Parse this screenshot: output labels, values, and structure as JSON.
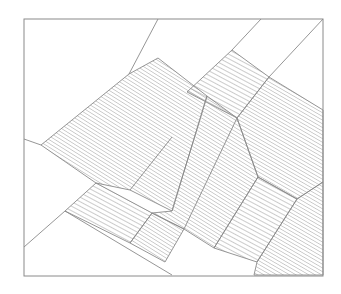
{
  "diagram": {
    "title": "",
    "frame": {
      "x1": 24,
      "y1": 19,
      "x2": 323,
      "y2": 276
    },
    "stroke_color": "#8a8a8a",
    "hatch_color": "#9a9a9a",
    "background": "#ffffff",
    "regions": [
      {
        "name": "large-band-left",
        "hatch": "steep",
        "points": "129,74 158,58 207,96 172,211 130,190 96,183 41,145"
      },
      {
        "name": "upper-parallelogram",
        "hatch": "shallow",
        "points": "232,50 269,77 237,118 187,92"
      },
      {
        "name": "central-band",
        "hatch": "steep",
        "points": "207,96 237,118 258,177 214,248 184,229 152,213 172,211"
      },
      {
        "name": "right-band",
        "hatch": "descending",
        "points": "237,118 269,77 323,110 323,182 297,199 258,177"
      },
      {
        "name": "lower-left-parallelogram",
        "hatch": "shallow",
        "points": "96,183 152,213 130,243 65,211"
      },
      {
        "name": "bottom-square",
        "hatch": "steep",
        "points": "152,213 184,229 165,262 130,243"
      },
      {
        "name": "lower-right-parallelogram",
        "hatch": "shallow",
        "points": "258,177 297,199 257,262 214,248"
      },
      {
        "name": "bottom-right-region",
        "hatch": "descending",
        "points": "297,199 323,182 323,275 254,275 257,262"
      }
    ],
    "lines": [
      {
        "name": "top-left-diagonal",
        "x1": 158,
        "y1": 19,
        "x2": 129,
        "y2": 74
      },
      {
        "name": "top-right-diagonal-a",
        "x1": 261,
        "y1": 19,
        "x2": 232,
        "y2": 50
      },
      {
        "name": "top-right-diagonal-b",
        "x1": 323,
        "y1": 19,
        "x2": 269,
        "y2": 77
      },
      {
        "name": "left-edge-line",
        "x1": 24,
        "y1": 139,
        "x2": 41,
        "y2": 145
      },
      {
        "name": "lower-left-diagonal",
        "x1": 24,
        "y1": 247,
        "x2": 65,
        "y2": 211
      },
      {
        "name": "lower-left-base",
        "x1": 65,
        "y1": 211,
        "x2": 172,
        "y2": 275
      },
      {
        "name": "center-dashed-a",
        "x1": 172,
        "y1": 137,
        "x2": 130,
        "y2": 190
      },
      {
        "name": "center-dashed-b",
        "x1": 237,
        "y1": 118,
        "x2": 184,
        "y2": 229
      }
    ]
  }
}
